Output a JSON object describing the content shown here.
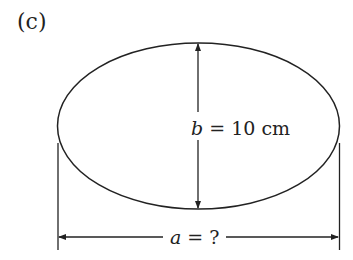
{
  "figure": {
    "panel_label": "(c)",
    "shape": "ellipse",
    "minor_axis_label": {
      "variable": "b",
      "text": " = 10 cm"
    },
    "major_axis_label": {
      "variable": "a",
      "text": " = ?"
    }
  },
  "colors": {
    "stroke": "#222222",
    "background": "#ffffff"
  }
}
